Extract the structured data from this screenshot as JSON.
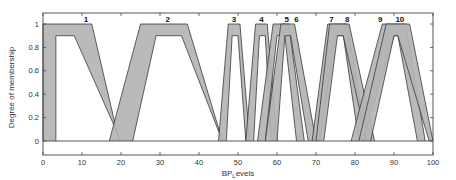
{
  "chart_data": {
    "type": "area",
    "title": "",
    "xlabel": "BP_Levels",
    "ylabel": "Degree of membership",
    "xlim": [
      0,
      100
    ],
    "ylim": [
      -0.1,
      1.1
    ],
    "x_ticks": [
      0,
      10,
      20,
      30,
      40,
      50,
      60,
      70,
      80,
      90,
      100
    ],
    "y_ticks": [
      0,
      0.2,
      0.4,
      0.6,
      0.8,
      1
    ],
    "grid": false,
    "legend": "none",
    "lower_mf_height": 0.9,
    "series": [
      {
        "name": "1",
        "label_x": 11,
        "umf": [
          0,
          0,
          12.5,
          19.5
        ],
        "lmf": [
          3.3,
          3.3,
          8,
          20
        ]
      },
      {
        "name": "2",
        "label_x": 32,
        "umf": [
          17,
          25,
          37,
          46
        ],
        "lmf": [
          23,
          29,
          35.5,
          46
        ]
      },
      {
        "name": "3",
        "label_x": 49,
        "umf": [
          45,
          47.5,
          50.5,
          53
        ],
        "lmf": [
          47,
          48.5,
          50,
          52
        ]
      },
      {
        "name": "4",
        "label_x": 56,
        "umf": [
          52,
          54.5,
          57.5,
          60
        ],
        "lmf": [
          54,
          55.5,
          57,
          58.5
        ]
      },
      {
        "name": "5",
        "label_x": 62.5,
        "umf": [
          55,
          59,
          63,
          67
        ],
        "lmf": [
          57,
          60,
          62,
          65
        ]
      },
      {
        "name": "6",
        "label_x": 65,
        "umf": [
          57,
          61,
          64.5,
          70
        ],
        "lmf": [
          60,
          62,
          63.5,
          68
        ]
      },
      {
        "name": "7",
        "label_x": 74,
        "umf": [
          69,
          73,
          78,
          83
        ],
        "lmf": [
          71,
          75,
          77,
          81
        ]
      },
      {
        "name": "8",
        "label_x": 78,
        "umf": [
          70,
          73.5,
          78.5,
          85
        ],
        "lmf": [
          72,
          75.5,
          77,
          83
        ]
      },
      {
        "name": "9",
        "label_x": 86.5,
        "umf": [
          79,
          87,
          93,
          98
        ],
        "lmf": [
          82,
          90,
          91,
          96
        ]
      },
      {
        "name": "10",
        "label_x": 91.5,
        "umf": [
          81,
          88,
          94,
          100
        ],
        "lmf": [
          84,
          90,
          91,
          99
        ]
      }
    ]
  },
  "colors": {
    "fill": "#b4b4b4",
    "stroke": "#3a3a3a",
    "axis": "#444444",
    "background": "#ffffff"
  }
}
